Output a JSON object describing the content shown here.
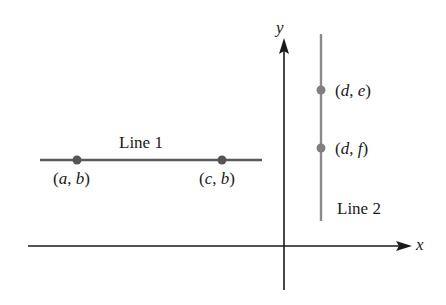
{
  "diagram": {
    "type": "coordinate-plane",
    "axes": {
      "x_label": "x",
      "y_label": "y",
      "color": "#1a1a1a"
    },
    "line1": {
      "label": "Line 1",
      "orientation": "horizontal",
      "color": "#5a5a5a",
      "points": [
        {
          "label_open": "(",
          "v1": "a",
          "sep": ", ",
          "v2": "b",
          "label_close": ")"
        },
        {
          "label_open": "(",
          "v1": "c",
          "sep": ", ",
          "v2": "b",
          "label_close": ")"
        }
      ]
    },
    "line2": {
      "label": "Line 2",
      "orientation": "vertical",
      "color": "#8a8a8a",
      "points": [
        {
          "label_open": "(",
          "v1": "d",
          "sep": ", ",
          "v2": "e",
          "label_close": ")"
        },
        {
          "label_open": "(",
          "v1": "d",
          "sep": ", ",
          "v2": "f",
          "label_close": ")"
        }
      ]
    },
    "point_color": "#606060"
  }
}
